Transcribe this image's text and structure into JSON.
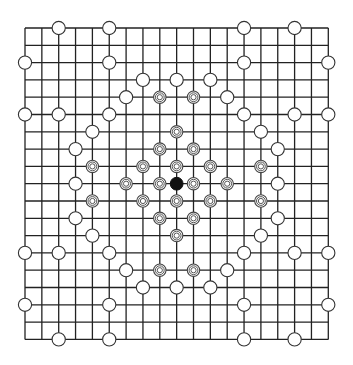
{
  "board": {
    "size": 19,
    "origin_x": 25,
    "origin_y": 28,
    "step_x": 16.85,
    "step_y": 17.3,
    "line_color": "#222222",
    "bg_color": "#ffffff"
  },
  "pieces": {
    "black": [
      [
        9,
        9
      ]
    ],
    "ringed": [
      [
        9,
        6
      ],
      [
        8,
        7
      ],
      [
        10,
        7
      ],
      [
        7,
        8
      ],
      [
        9,
        8
      ],
      [
        11,
        8
      ],
      [
        6,
        9
      ],
      [
        8,
        9
      ],
      [
        10,
        9
      ],
      [
        12,
        9
      ],
      [
        7,
        10
      ],
      [
        9,
        10
      ],
      [
        11,
        10
      ],
      [
        8,
        11
      ],
      [
        10,
        11
      ],
      [
        9,
        12
      ],
      [
        8,
        4
      ],
      [
        10,
        4
      ],
      [
        8,
        14
      ],
      [
        10,
        14
      ],
      [
        4,
        8
      ],
      [
        4,
        10
      ],
      [
        14,
        8
      ],
      [
        14,
        10
      ]
    ],
    "white": [
      [
        2,
        0
      ],
      [
        5,
        0
      ],
      [
        13,
        0
      ],
      [
        16,
        0
      ],
      [
        0,
        2
      ],
      [
        5,
        2
      ],
      [
        13,
        2
      ],
      [
        18,
        2
      ],
      [
        7,
        3
      ],
      [
        9,
        3
      ],
      [
        11,
        3
      ],
      [
        6,
        4
      ],
      [
        12,
        4
      ],
      [
        0,
        5
      ],
      [
        2,
        5
      ],
      [
        5,
        5
      ],
      [
        13,
        5
      ],
      [
        16,
        5
      ],
      [
        18,
        5
      ],
      [
        4,
        6
      ],
      [
        14,
        6
      ],
      [
        3,
        7
      ],
      [
        15,
        7
      ],
      [
        3,
        9
      ],
      [
        15,
        9
      ],
      [
        3,
        11
      ],
      [
        15,
        11
      ],
      [
        4,
        12
      ],
      [
        14,
        12
      ],
      [
        0,
        13
      ],
      [
        2,
        13
      ],
      [
        5,
        13
      ],
      [
        13,
        13
      ],
      [
        16,
        13
      ],
      [
        18,
        13
      ],
      [
        6,
        14
      ],
      [
        12,
        14
      ],
      [
        7,
        15
      ],
      [
        9,
        15
      ],
      [
        11,
        15
      ],
      [
        0,
        16
      ],
      [
        5,
        16
      ],
      [
        13,
        16
      ],
      [
        18,
        16
      ],
      [
        2,
        18
      ],
      [
        5,
        18
      ],
      [
        13,
        18
      ],
      [
        16,
        18
      ]
    ]
  }
}
